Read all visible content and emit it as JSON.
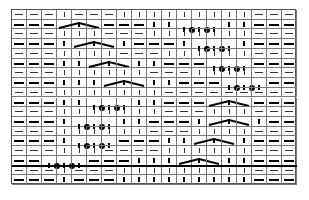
{
  "chart_data": {
    "type": "table",
    "title": "",
    "columns": 19,
    "rows": 18,
    "legend": {
      "p": "purl (horizontal dash)",
      "k": "knit (vertical bar)",
      "C": "3-stitch cable/decrease (peaked line)",
      "T": "3-stitch twist with dots",
      "x": "cell covered by multi-stitch symbol"
    },
    "grid": [
      "pppkpppkkkkkkkkkppp",
      "pppCxxpppkkTxxkkppp",
      "pppkkkpppkkkkkkkppp",
      "pppkCxxkpppkTxxkppp",
      "pppkkkkpppkkkkkkppp",
      "pppkkCxxkkpppTxxppp",
      "pppkkkkkkpppkkkkppp",
      "pppkkkCxxkkpppTxxpp",
      "pppkkkkkkkppppppppp",
      "pppkkTxxkkpppCxxppp",
      "pppkkkkkkkpppkkkppp",
      "pppkTxxkkpppkCxxkpp",
      "pppkkkkkkpppkkkkppp",
      "pppkTxxpppkkCxxkppp",
      "pppkkkppppkkkkkkppp",
      "ppTxxpppkkkCxxkkppp",
      "pppkpppkkkkkkkkkppp",
      "pppkpppkkkkkkkkkppp"
    ],
    "separator_after_row": 16
  }
}
